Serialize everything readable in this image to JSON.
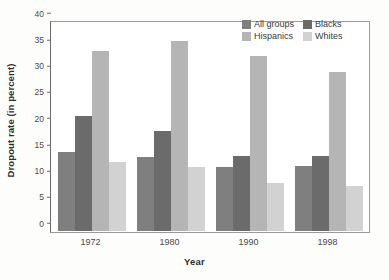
{
  "chart_data": {
    "type": "bar",
    "title": "",
    "subtitle": "",
    "xlabel": "Year",
    "ylabel": "Dropout rate (in percent)",
    "categories": [
      "1972",
      "1980",
      "1990",
      "1998"
    ],
    "series": [
      {
        "name": "All groups",
        "color": "#7f7f7f",
        "values": [
          15.0,
          14.1,
          12.2,
          12.4
        ]
      },
      {
        "name": "Blacks",
        "color": "#6b6b6b",
        "values": [
          21.9,
          19.1,
          14.3,
          14.3
        ]
      },
      {
        "name": "Hispanics",
        "color": "#b5b5b5",
        "values": [
          34.2,
          36.2,
          33.4,
          30.3
        ]
      },
      {
        "name": "Whites",
        "color": "#d2d2d2",
        "values": [
          13.1,
          12.2,
          9.2,
          8.5
        ]
      }
    ],
    "ylim": [
      0,
      40
    ],
    "yticks": [
      0,
      5,
      10,
      15,
      20,
      25,
      30,
      35,
      40
    ],
    "ytick_labels": [
      "0",
      "5",
      "10",
      "15",
      "20",
      "25",
      "30",
      "35",
      "40"
    ],
    "grid": false,
    "legend_position": "top-right",
    "frame": true
  },
  "legend": {
    "items": [
      {
        "label": "All groups",
        "color": "#7f7f7f"
      },
      {
        "label": "Blacks",
        "color": "#6b6b6b"
      },
      {
        "label": "Hispanics",
        "color": "#b5b5b5"
      },
      {
        "label": "Whites",
        "color": "#d2d2d2"
      }
    ]
  },
  "axes": {
    "y_title": "Dropout rate (in percent)",
    "x_title": "Year"
  }
}
